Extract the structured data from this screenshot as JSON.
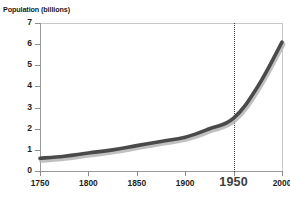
{
  "chart_data": {
    "type": "line",
    "title": "",
    "ylabel": "Population (billions)",
    "xlabel": "",
    "xlim": [
      1750,
      2000
    ],
    "ylim": [
      0,
      7
    ],
    "grid": false,
    "legend": "none",
    "x": [
      1750,
      1775,
      1800,
      1825,
      1850,
      1875,
      1900,
      1925,
      1950,
      1975,
      2000
    ],
    "series": [
      {
        "name": "World population",
        "values": [
          0.6,
          0.7,
          0.85,
          1.0,
          1.2,
          1.4,
          1.6,
          2.0,
          2.5,
          4.0,
          6.1
        ]
      }
    ],
    "x_tick_labels": [
      "1750",
      "1800",
      "1850",
      "1900",
      "1950",
      "2000"
    ],
    "x_tick_values": [
      1750,
      1800,
      1850,
      1900,
      1950,
      2000
    ],
    "x_emphasized_tick": "1950",
    "y_tick_labels": [
      "0",
      "1",
      "2",
      "3",
      "4",
      "5",
      "6",
      "7"
    ],
    "y_tick_values": [
      0,
      1,
      2,
      3,
      4,
      5,
      6,
      7
    ],
    "annotations": [
      {
        "type": "vertical-reference-line",
        "x": 1950,
        "style": "dotted",
        "label": "1950"
      }
    ],
    "colors": {
      "line": "#4a4a4a",
      "line_shadow": "#b5b5b5",
      "axis": "#9a9a9a",
      "frame_light": "#c9c9c9",
      "reference_line": "#3a3a3a",
      "text": "#231f20",
      "background": "#ffffff"
    }
  }
}
